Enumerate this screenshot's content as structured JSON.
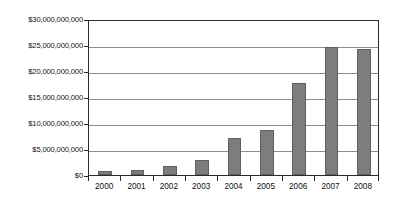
{
  "chart_data": {
    "type": "bar",
    "title": "",
    "xlabel": "",
    "ylabel": "",
    "categories": [
      "2000",
      "2001",
      "2002",
      "2003",
      "2004",
      "2005",
      "2006",
      "2007",
      "2008"
    ],
    "values": [
      700000000,
      1000000000,
      1700000000,
      2800000000,
      7200000000,
      8600000000,
      17700000000,
      24600000000,
      24300000000
    ],
    "ylim": [
      0,
      30000000000
    ],
    "ytick_values": [
      0,
      5000000000,
      10000000000,
      15000000000,
      20000000000,
      25000000000,
      30000000000
    ],
    "ytick_labels": [
      "$0",
      "$5,000,000,000",
      "$10,000,000,000",
      "$15,000,000,000",
      "$20,000,000,000",
      "$25,000,000,000",
      "$30,000,000,000"
    ],
    "grid": true,
    "grid_axis": "y",
    "legend": false,
    "legend_position": "none",
    "series": [
      {
        "name": "",
        "values": [
          700000000,
          1000000000,
          1700000000,
          2800000000,
          7200000000,
          8600000000,
          17700000000,
          24600000000,
          24300000000
        ]
      }
    ],
    "bar_color": "#7d7d7d",
    "bar_edge_color": "#5f5f5f",
    "gridline_color": "#8d8d8d",
    "axis_color": "#2b2b2b",
    "background_color": "#ffffff"
  }
}
